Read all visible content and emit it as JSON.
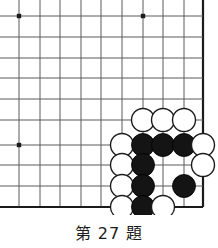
{
  "figure": {
    "type": "go-board-problem-diagram",
    "caption": "第 27 題",
    "caption_parts": {
      "prefix": "第",
      "number": "27",
      "suffix": "題"
    }
  },
  "colors": {
    "background": "#ffffff",
    "grid_line": "#5a5a5a",
    "edge_line": "#1b1b1b",
    "black_stone_fill": "#141414",
    "black_stone_stroke": "#000000",
    "white_stone_fill": "#ffffff",
    "white_stone_stroke": "#1b1b1b",
    "star_point": "#1b1b1b",
    "caption_text": "#1b1b1b"
  },
  "board": {
    "note": "Lower-right corner of a Go board; cropped at top and left edges",
    "columns_x": [
      19,
      40,
      60,
      81,
      101,
      122,
      143,
      163,
      184,
      203
    ],
    "rows_y": [
      16,
      37,
      58,
      78,
      99,
      120,
      145,
      165,
      186,
      207
    ],
    "grid_step": 20.6,
    "edges": {
      "right_x": 203,
      "bottom_y": 207,
      "top_cropped": true,
      "left_cropped": true
    },
    "star_points": [
      {
        "x": 19,
        "y": 16
      },
      {
        "x": 143,
        "y": 16
      },
      {
        "x": 19,
        "y": 145
      }
    ],
    "stone_radius": 11.5,
    "stones": [
      {
        "color": "white",
        "x": 143,
        "y": 120
      },
      {
        "color": "white",
        "x": 163,
        "y": 120
      },
      {
        "color": "white",
        "x": 184,
        "y": 120
      },
      {
        "color": "white",
        "x": 122,
        "y": 145
      },
      {
        "color": "black",
        "x": 143,
        "y": 145
      },
      {
        "color": "black",
        "x": 163,
        "y": 145
      },
      {
        "color": "black",
        "x": 184,
        "y": 145
      },
      {
        "color": "white",
        "x": 203,
        "y": 145
      },
      {
        "color": "white",
        "x": 122,
        "y": 165
      },
      {
        "color": "black",
        "x": 143,
        "y": 165
      },
      {
        "color": "white",
        "x": 203,
        "y": 165
      },
      {
        "color": "white",
        "x": 122,
        "y": 186
      },
      {
        "color": "black",
        "x": 143,
        "y": 186
      },
      {
        "color": "black",
        "x": 184,
        "y": 186
      },
      {
        "color": "white",
        "x": 122,
        "y": 207
      },
      {
        "color": "black",
        "x": 143,
        "y": 207
      },
      {
        "color": "white",
        "x": 163,
        "y": 207
      }
    ],
    "stone_counts": {
      "black": 7,
      "white": 10,
      "total": 17
    }
  }
}
